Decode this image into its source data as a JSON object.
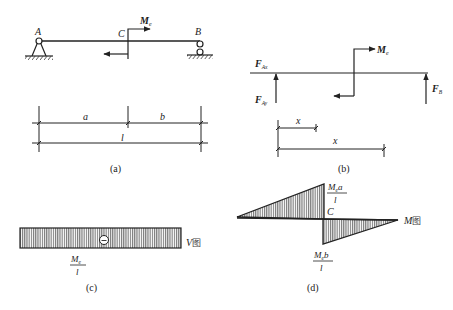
{
  "panel_a": {
    "caption": "(a)",
    "point_A": "A",
    "point_B": "B",
    "point_C": "C",
    "moment_label": "M",
    "moment_sub": "e",
    "dim_a": "a",
    "dim_b": "b",
    "dim_l": "l"
  },
  "panel_b": {
    "caption": "(b)",
    "F_Ax": "F",
    "F_Ax_sub": "Ax",
    "F_Ay": "F",
    "F_Ay_sub": "Ay",
    "F_B": "F",
    "F_B_sub": "B",
    "moment_label": "M",
    "moment_sub": "e",
    "dim_x1": "x",
    "dim_x2": "x"
  },
  "panel_c": {
    "caption": "(c)",
    "diagram_label": "V图",
    "sign": "⊖",
    "value_num": "M",
    "value_num_sub": "e",
    "value_den": "l"
  },
  "panel_d": {
    "caption": "(d)",
    "diagram_label": "M图",
    "point_C": "C",
    "top_num": "M",
    "top_num_sub": "e",
    "top_num_tail": "a",
    "top_den": "l",
    "bottom_num": "M",
    "bottom_num_sub": "e",
    "bottom_num_tail": "b",
    "bottom_den": "l"
  },
  "colors": {
    "ink": "#222222",
    "hatch": "#555555",
    "fill": "#d8d8d8"
  }
}
